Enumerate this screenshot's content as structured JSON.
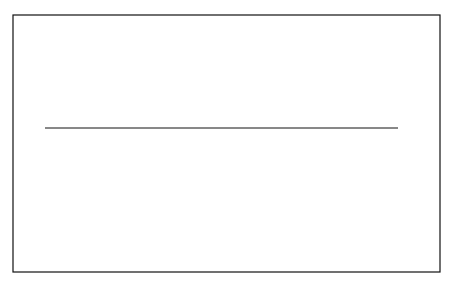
{
  "figure": {
    "frame": {
      "x": 13,
      "y": 15,
      "width": 427,
      "height": 257
    },
    "colors": {
      "ink": "#111111",
      "background": "#ffffff"
    },
    "top_panel": {
      "description": "Family of nine double-humped curves over a baseline",
      "curve_count": 9,
      "baseline": {
        "x1": 45,
        "x2": 398,
        "y": 128
      }
    },
    "bottom_panel": {
      "description": "Cross-section of two ridges with numbered layers",
      "labels": {
        "left_R": "R",
        "B": "B",
        "O": "O",
        "A": "A",
        "right_R": "R"
      },
      "layer_numbers_left": [
        "1",
        "2",
        "3",
        "4",
        "5",
        "6",
        "7",
        "8"
      ],
      "layer_numbers_right": [
        "8",
        "7",
        "6",
        "5",
        "4",
        "3",
        "2",
        "1"
      ]
    }
  }
}
